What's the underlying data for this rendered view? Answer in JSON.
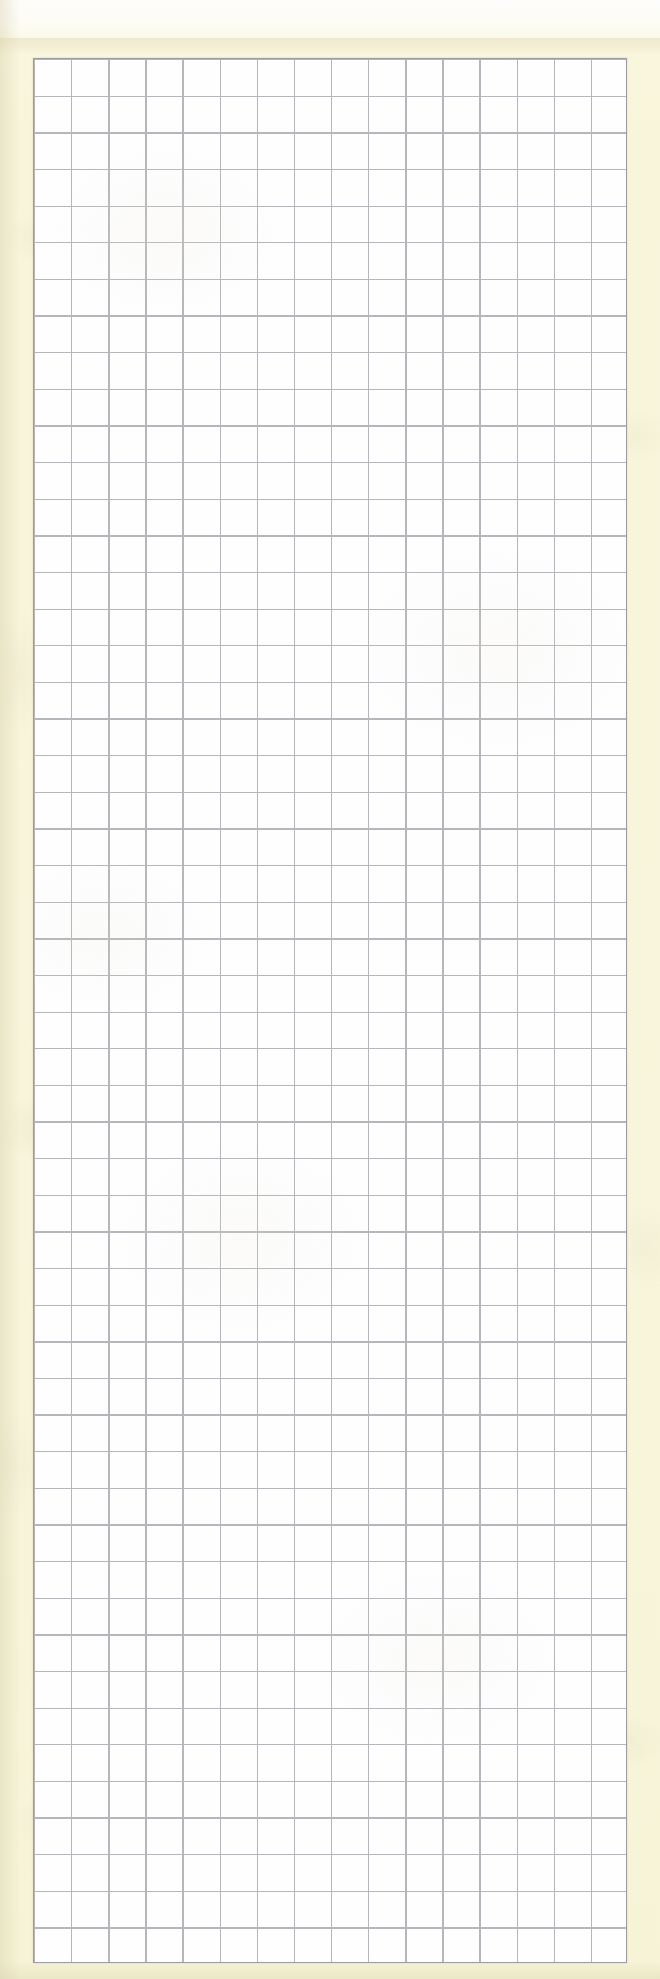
{
  "document": {
    "kind": "scanned-graph-paper",
    "title": "Blank graph paper scan",
    "has_text_content": false,
    "has_handwriting": false,
    "notes": "Empty quadrille / squared paper sheet; no writing, labels or markings present"
  },
  "canvas": {
    "width_px": 660,
    "height_px": 1979
  },
  "paper": {
    "background_color": "#f8f5db",
    "top_band_color": "#fdfdfb",
    "grain_color": "#e4dcc0",
    "margin_left_px": 33,
    "margin_right_px": 33,
    "margin_top_px": 58,
    "margin_bottom_px": 16
  },
  "grid": {
    "label": "ruled square grid",
    "x_px": 33,
    "y_px": 58,
    "width_px": 594,
    "height_px": 1905,
    "columns": 16,
    "rows": 52,
    "cell_width_px": 37.125,
    "cell_height_px": 36.635,
    "cell_fill_color": "#fefeff",
    "rule_color": "#b5b5bb",
    "rule_width_px": 1.3,
    "border_color": "#9b9ba1",
    "border_width_px": 1.4
  }
}
